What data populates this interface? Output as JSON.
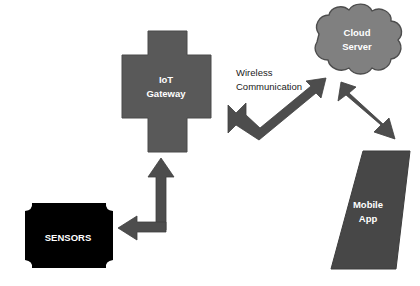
{
  "diagram": {
    "background_color": "#ffffff",
    "nodes": {
      "sensors": {
        "label": "SENSORS",
        "shape": "rounded-octagon",
        "fill": "#000000",
        "text_color": "#ffffff"
      },
      "gateway": {
        "label_line1": "IoT",
        "label_line2": "Gateway",
        "shape": "cross",
        "fill": "#595959",
        "text_color": "#ffffff"
      },
      "cloud": {
        "label_line1": "Cloud",
        "label_line2": "Server",
        "shape": "cloud",
        "fill": "#808080",
        "stroke": "#4d4d4d",
        "text_color": "#ffffff"
      },
      "mobile": {
        "label_line1": "Mobile",
        "label_line2": "App",
        "shape": "parallelogram",
        "fill": "#474747",
        "text_color": "#ffffff"
      }
    },
    "edges": {
      "sensors_gateway": {
        "label": "",
        "style": "elbow-double-arrow",
        "color": "#4d4d4d",
        "from": "sensors",
        "to": "gateway"
      },
      "gateway_cloud": {
        "label_line1": "Wireless",
        "label_line2": "Communication",
        "style": "bent-double-arrow",
        "color": "#4d4d4d",
        "from": "gateway",
        "to": "cloud"
      },
      "cloud_mobile": {
        "label": "",
        "style": "bent-double-arrow",
        "color": "#4d4d4d",
        "from": "cloud",
        "to": "mobile"
      }
    }
  }
}
